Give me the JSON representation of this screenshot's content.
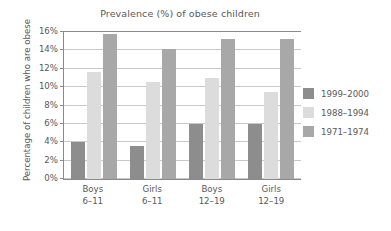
{
  "chart_data": {
    "type": "bar",
    "title": "Prevalence (%) of obese children",
    "xlabel": "",
    "ylabel": "Percentage of children who are obese",
    "categories": [
      "Boys\n6–11",
      "Girls\n6–11",
      "Boys\n12–19",
      "Girls\n12–19"
    ],
    "category_lines": [
      {
        "line1": "Boys",
        "line2": "6–11"
      },
      {
        "line1": "Girls",
        "line2": "6–11"
      },
      {
        "line1": "Boys",
        "line2": "12–19"
      },
      {
        "line1": "Girls",
        "line2": "12–19"
      }
    ],
    "series": [
      {
        "name": "1999–2000",
        "color": "#8d8d8d",
        "values": [
          4.0,
          3.6,
          6.0,
          6.0
        ]
      },
      {
        "name": "1988–1994",
        "color": "#dcdcdc",
        "values": [
          11.6,
          10.6,
          11.0,
          9.5
        ]
      },
      {
        "name": "1971–1974",
        "color": "#a8a8a8",
        "values": [
          15.8,
          14.2,
          15.2,
          15.2
        ]
      }
    ],
    "ylim": [
      0,
      16
    ],
    "ytick_values": [
      0,
      2,
      4,
      6,
      8,
      10,
      12,
      14,
      16
    ],
    "ytick_labels": [
      "0%",
      "2%",
      "4%",
      "6%",
      "8%",
      "10%",
      "12%",
      "14%",
      "16%"
    ],
    "grid": true,
    "legend_position": "right",
    "axis_color": "#8a8a8a",
    "grid_color": "#c9c9c9",
    "text_color": "#58585a"
  }
}
